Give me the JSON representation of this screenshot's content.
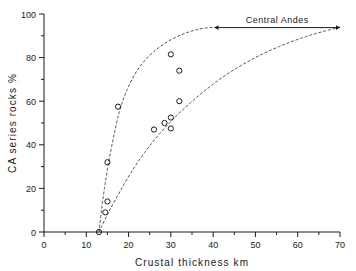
{
  "chart_data": {
    "type": "scatter",
    "title": "",
    "xlabel": "Crustal thickness   km",
    "ylabel": "CA  series  rocks   %",
    "xlim": [
      0,
      70
    ],
    "ylim": [
      0,
      100
    ],
    "grid": false,
    "legend": null,
    "x_ticks": [
      0,
      10,
      20,
      30,
      40,
      50,
      60,
      70
    ],
    "x_tick_labels": [
      "0",
      "10",
      "20",
      "30",
      "40",
      "50",
      "60",
      "70"
    ],
    "x_minor_ticks": [
      5,
      15,
      25,
      35,
      45,
      55,
      65
    ],
    "y_ticks": [
      0,
      20,
      40,
      60,
      80,
      100
    ],
    "y_tick_labels": [
      "0",
      "20",
      "40",
      "60",
      "80",
      "100"
    ],
    "y_minor_ticks": [
      10,
      30,
      50,
      70,
      90
    ],
    "points": [
      {
        "x": 13.0,
        "y": 0.0
      },
      {
        "x": 14.5,
        "y": 9.0
      },
      {
        "x": 15.0,
        "y": 14.0
      },
      {
        "x": 15.0,
        "y": 32.0
      },
      {
        "x": 17.5,
        "y": 57.5
      },
      {
        "x": 26.0,
        "y": 47.0
      },
      {
        "x": 28.5,
        "y": 50.0
      },
      {
        "x": 30.0,
        "y": 52.5
      },
      {
        "x": 30.0,
        "y": 47.5
      },
      {
        "x": 30.0,
        "y": 81.5
      },
      {
        "x": 32.0,
        "y": 74.0
      },
      {
        "x": 32.0,
        "y": 60.0
      }
    ],
    "curves": [
      {
        "name": "upper-envelope",
        "style": "dashed",
        "points": [
          {
            "x": 13.0,
            "y": 0.0
          },
          {
            "x": 13.6,
            "y": 10.0
          },
          {
            "x": 14.3,
            "y": 20.0
          },
          {
            "x": 15.2,
            "y": 31.0
          },
          {
            "x": 16.4,
            "y": 43.0
          },
          {
            "x": 17.8,
            "y": 55.0
          },
          {
            "x": 19.6,
            "y": 65.0
          },
          {
            "x": 22.0,
            "y": 74.0
          },
          {
            "x": 25.0,
            "y": 81.0
          },
          {
            "x": 28.5,
            "y": 86.5
          },
          {
            "x": 32.5,
            "y": 90.5
          },
          {
            "x": 36.5,
            "y": 93.0
          },
          {
            "x": 40.3,
            "y": 94.0
          }
        ]
      },
      {
        "name": "lower-envelope",
        "style": "dashed",
        "points": [
          {
            "x": 13.0,
            "y": 0.0
          },
          {
            "x": 15.0,
            "y": 8.0
          },
          {
            "x": 17.5,
            "y": 17.0
          },
          {
            "x": 20.5,
            "y": 27.0
          },
          {
            "x": 24.0,
            "y": 37.0
          },
          {
            "x": 28.0,
            "y": 46.5
          },
          {
            "x": 32.5,
            "y": 55.5
          },
          {
            "x": 37.5,
            "y": 64.0
          },
          {
            "x": 43.0,
            "y": 72.0
          },
          {
            "x": 49.0,
            "y": 79.0
          },
          {
            "x": 55.5,
            "y": 85.0
          },
          {
            "x": 62.5,
            "y": 90.0
          },
          {
            "x": 70.0,
            "y": 94.0
          }
        ]
      }
    ],
    "annotations": [
      {
        "name": "central-andes-range",
        "text": "Central  Andes",
        "arrow": "double",
        "x_start": 40.3,
        "x_end": 70.0,
        "y": 94.0
      }
    ],
    "marker": {
      "shape": "open-circle",
      "radius_px": 2.6,
      "color": "#1a1a1a"
    },
    "line_color": "#555555"
  }
}
